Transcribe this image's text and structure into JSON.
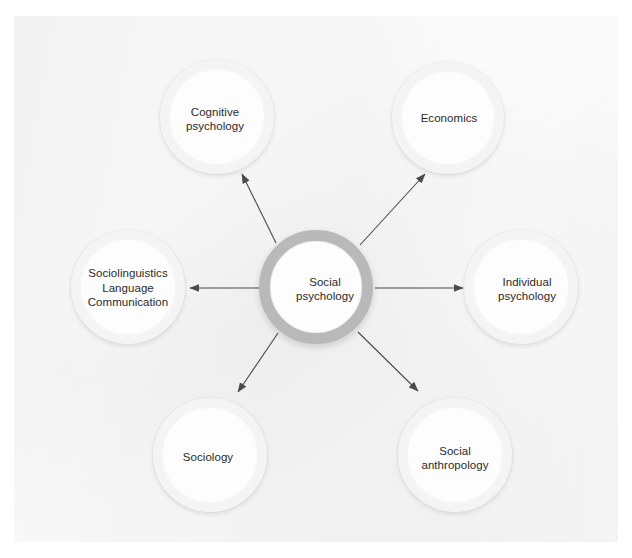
{
  "diagram": {
    "type": "radial-hub-and-spoke",
    "title": "",
    "background_color": "#fafafa",
    "hub_ring_color": "#b9b9b9",
    "leaf_ring_color": "#f4f4f4",
    "edge_color": "#4a4a4a",
    "text_color": "#2b2b2b",
    "hub": {
      "id": "social-psychology",
      "label": "Social\npsychology",
      "cx": 316,
      "cy": 287,
      "r": 57
    },
    "nodes": [
      {
        "id": "cognitive-psychology",
        "label": "Cognitive\npsychology",
        "cx": 217,
        "cy": 117,
        "r": 57
      },
      {
        "id": "economics",
        "label": "Economics",
        "cx": 448,
        "cy": 118,
        "r": 56
      },
      {
        "id": "sociolinguistics",
        "label": "Sociolinguistics\nLanguage\nCommunication",
        "cx": 128,
        "cy": 287,
        "r": 57
      },
      {
        "id": "individual-psychology",
        "label": "Individual\npsychology",
        "cx": 521,
        "cy": 287,
        "r": 57
      },
      {
        "id": "sociology",
        "label": "Sociology",
        "cx": 210,
        "cy": 455,
        "r": 57
      },
      {
        "id": "social-anthropology",
        "label": "Social\nanthropology",
        "cx": 455,
        "cy": 455,
        "r": 57
      }
    ],
    "edges": [
      {
        "id": "edge-to-cognitive-psychology",
        "from": "social-psychology",
        "to": "cognitive-psychology",
        "direction": "one-way",
        "x1": 276,
        "y1": 243,
        "x2": 242,
        "y2": 174
      },
      {
        "id": "edge-to-economics",
        "from": "social-psychology",
        "to": "economics",
        "direction": "one-way",
        "x1": 360,
        "y1": 245,
        "x2": 425,
        "y2": 174
      },
      {
        "id": "edge-to-sociolinguistics",
        "from": "social-psychology",
        "to": "sociolinguistics",
        "direction": "one-way",
        "x1": 259,
        "y1": 288,
        "x2": 190,
        "y2": 288
      },
      {
        "id": "edge-to-individual-psychology",
        "from": "social-psychology",
        "to": "individual-psychology",
        "direction": "one-way",
        "x1": 375,
        "y1": 288,
        "x2": 463,
        "y2": 288
      },
      {
        "id": "edge-to-sociology",
        "from": "social-psychology",
        "to": "sociology",
        "direction": "one-way",
        "x1": 278,
        "y1": 333,
        "x2": 238,
        "y2": 392
      },
      {
        "id": "edge-to-social-anthropology",
        "from": "social-psychology",
        "to": "social-anthropology",
        "direction": "one-way",
        "x1": 358,
        "y1": 332,
        "x2": 418,
        "y2": 391
      }
    ]
  }
}
